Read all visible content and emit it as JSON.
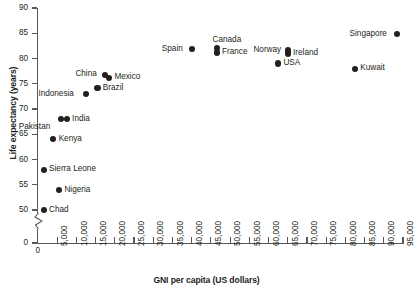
{
  "chart_data": {
    "type": "scatter",
    "title": "",
    "xlabel": "GNI per capita (US dollars)",
    "ylabel": "Life expectancy (years)",
    "xlim": [
      0,
      95000
    ],
    "ylim": [
      0,
      90
    ],
    "y_axis_break": true,
    "y_break_range": [
      0,
      50
    ],
    "grid": false,
    "legend": "none",
    "xticks": [
      "0",
      "5,000",
      "10,000",
      "15,000",
      "20,000",
      "25,000",
      "30,000",
      "35,000",
      "40,000",
      "45,000",
      "50,000",
      "55,000",
      "60,000",
      "65,000",
      "70,000",
      "75,000",
      "80,000",
      "85,000",
      "90,000",
      "95,000"
    ],
    "xtick_values": [
      0,
      5000,
      10000,
      15000,
      20000,
      25000,
      30000,
      35000,
      40000,
      45000,
      50000,
      55000,
      60000,
      65000,
      70000,
      75000,
      80000,
      85000,
      90000,
      95000
    ],
    "yticks": [
      "0",
      "50",
      "55",
      "60",
      "65",
      "70",
      "75",
      "80",
      "85",
      "90"
    ],
    "ytick_values": [
      0,
      50,
      55,
      60,
      65,
      70,
      75,
      80,
      85,
      90
    ],
    "points": [
      {
        "label": "Chad",
        "x": 1500,
        "y": 50,
        "label_side": "right"
      },
      {
        "label": "Nigeria",
        "x": 5500,
        "y": 54,
        "label_side": "right"
      },
      {
        "label": "Sierra Leone",
        "x": 1500,
        "y": 58,
        "label_side": "right"
      },
      {
        "label": "Kenya",
        "x": 4000,
        "y": 64,
        "label_side": "right"
      },
      {
        "label": "Pakistan",
        "x": 6000,
        "y": 68,
        "label_side": "below-left"
      },
      {
        "label": "India",
        "x": 7500,
        "y": 68,
        "label_side": "right"
      },
      {
        "label": "Indonesia",
        "x": 12500,
        "y": 73,
        "label_side": "left"
      },
      {
        "label": "Brazil",
        "x": 15500,
        "y": 74.2,
        "label_side": "right"
      },
      {
        "label": "China",
        "x": 17500,
        "y": 76.8,
        "label_side": "left"
      },
      {
        "label": "Mexico",
        "x": 18500,
        "y": 76.2,
        "label_side": "right"
      },
      {
        "label": "Spain",
        "x": 40000,
        "y": 81.8,
        "label_side": "left"
      },
      {
        "label": "Canada",
        "x": 46500,
        "y": 82,
        "label_side": "above"
      },
      {
        "label": "France",
        "x": 46500,
        "y": 81.2,
        "label_side": "right"
      },
      {
        "label": "Norway",
        "x": 65000,
        "y": 81.6,
        "label_side": "left"
      },
      {
        "label": "Ireland",
        "x": 65000,
        "y": 81,
        "label_side": "right"
      },
      {
        "label": "USA",
        "x": 62500,
        "y": 79,
        "label_side": "right"
      },
      {
        "label": "Kuwait",
        "x": 82500,
        "y": 78,
        "label_side": "right"
      },
      {
        "label": "Singapore",
        "x": 93500,
        "y": 84.8,
        "label_side": "left"
      }
    ]
  }
}
